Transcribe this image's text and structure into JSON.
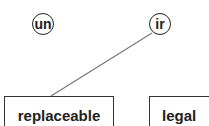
{
  "diagram": {
    "nodes": [
      {
        "id": "un",
        "label": "un",
        "shape": "circle"
      },
      {
        "id": "ir",
        "label": "ir",
        "shape": "circle"
      },
      {
        "id": "replaceable",
        "label": "replaceable",
        "shape": "box"
      },
      {
        "id": "legal",
        "label": "legal",
        "shape": "box"
      }
    ],
    "edges": [
      {
        "from": "ir",
        "to": "replaceable"
      }
    ],
    "colors": {
      "stroke": "#222222",
      "edge": "#777777",
      "background": "#ffffff"
    }
  }
}
